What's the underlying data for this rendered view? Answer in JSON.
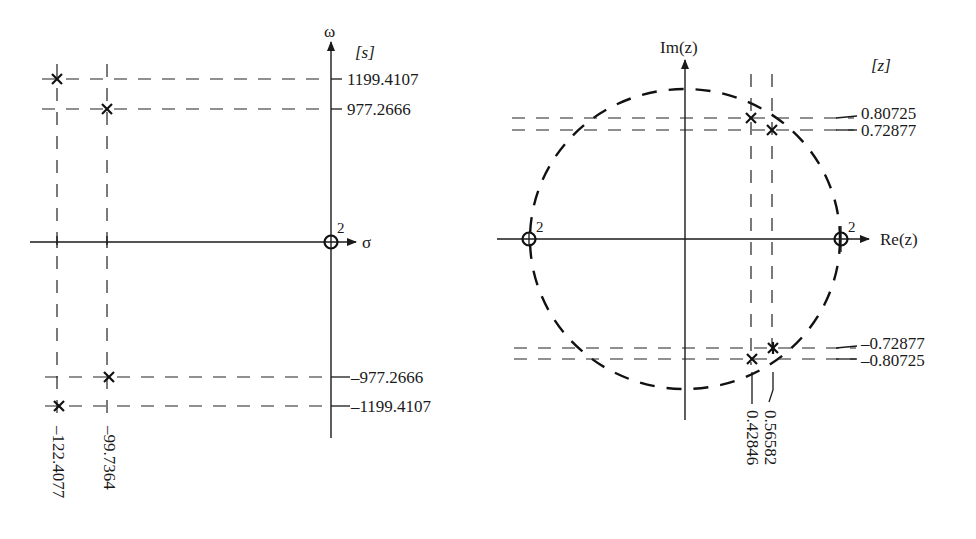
{
  "left_plot": {
    "plane_label": "[s]",
    "vertical_axis_label": "ω",
    "horizontal_axis_label": "σ",
    "zero_multiplicity": "2",
    "poles": [
      {
        "sigma": -122.4077,
        "omega": 1199.4107
      },
      {
        "sigma": -99.7364,
        "omega": 977.2666
      },
      {
        "sigma": -99.7364,
        "omega": -977.2666
      },
      {
        "sigma": -122.4077,
        "omega": -1199.4107
      }
    ],
    "zeros": [
      {
        "sigma": 0,
        "omega": 0,
        "order": 2
      }
    ],
    "y_tick_labels": [
      "1199.4107",
      "977.2666",
      "–977.2666",
      "–1199.4107"
    ],
    "x_tick_labels": [
      "–122.4077",
      "–99.7364"
    ]
  },
  "right_plot": {
    "plane_label": "[z]",
    "vertical_axis_label": "Im(z)",
    "horizontal_axis_label": "Re(z)",
    "unit_circle": "dashed",
    "zero_multiplicity_left": "2",
    "zero_multiplicity_right": "2",
    "poles": [
      {
        "re": 0.42846,
        "im": 0.80725
      },
      {
        "re": 0.56582,
        "im": 0.72877
      },
      {
        "re": 0.56582,
        "im": -0.72877
      },
      {
        "re": 0.42846,
        "im": -0.80725
      }
    ],
    "zeros": [
      {
        "re": -1,
        "im": 0,
        "order": 2
      },
      {
        "re": 1,
        "im": 0,
        "order": 2
      }
    ],
    "y_tick_labels": [
      "0.80725",
      "0.72877",
      "–0.72877",
      "–0.80725"
    ],
    "x_tick_labels": [
      "0.42846",
      "0.56582"
    ]
  }
}
